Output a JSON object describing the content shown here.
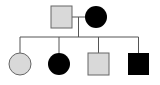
{
  "diagram": {
    "type": "pedigree",
    "colors": {
      "unaffected": "#d9d9d9",
      "affected": "#000000",
      "line": "#555555"
    },
    "parents": [
      {
        "id": "father",
        "sex": "male",
        "status": "unaffected"
      },
      {
        "id": "mother",
        "sex": "female",
        "status": "affected"
      }
    ],
    "children": [
      {
        "id": "daughter-1",
        "sex": "female",
        "status": "unaffected"
      },
      {
        "id": "daughter-2",
        "sex": "female",
        "status": "affected"
      },
      {
        "id": "son-1",
        "sex": "male",
        "status": "unaffected"
      },
      {
        "id": "son-2",
        "sex": "male",
        "status": "affected"
      }
    ]
  }
}
